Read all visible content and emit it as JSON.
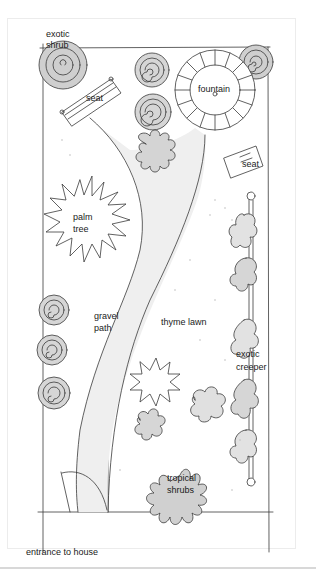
{
  "figure": {
    "type": "garden-plan-sketch",
    "caption": "entrance to house",
    "top_text_cropped": [
      "",
      "",
      "",
      ""
    ]
  },
  "labels": {
    "exotic_shrub": [
      "exotic",
      "shrub"
    ],
    "seat_top": "seat",
    "fountain": "fountain",
    "seat_right": "seat",
    "palm_tree": [
      "palm",
      "tree"
    ],
    "gravel_path": [
      "gravel",
      "path"
    ],
    "thyme_lawn": "thyme lawn",
    "exotic_creeper": [
      "exotic",
      "creeper"
    ],
    "tropical_shrubs": [
      "tropical",
      "shrubs"
    ]
  },
  "colors": {
    "ink": "#3a3a3a",
    "fill_grey": "#cfcfcf",
    "fill_light": "#e6e6e6",
    "path_fill": "#eeeeee",
    "card_border": "#ececec"
  }
}
